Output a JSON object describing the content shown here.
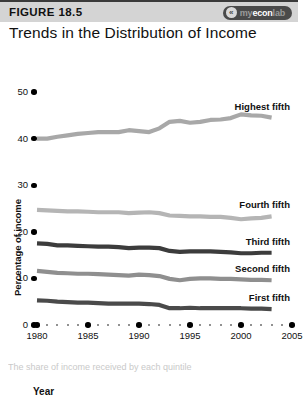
{
  "header": {
    "figure_number": "FIGURE 18.5",
    "brand_mark_glyph": "«",
    "brand_prefix": "my",
    "brand_main": "econ",
    "brand_suffix": "lab",
    "brand_full": "myeconlab"
  },
  "title": "Trends in the Distribution of Income",
  "bottom_caption": "The share of income received by each quintile",
  "chart_data": {
    "type": "line",
    "title": "Trends in the Distribution of Income",
    "xlabel": "Year",
    "ylabel": "Percentage of income",
    "xlim": [
      1980,
      2005
    ],
    "ylim": [
      0,
      50
    ],
    "y_ticks": [
      0,
      10,
      20,
      30,
      40,
      50
    ],
    "x_ticks": [
      1980,
      1985,
      1990,
      1995,
      2000,
      2005
    ],
    "x_minor_step": 1,
    "grid": false,
    "legend": "inline-end-labels",
    "x": [
      1980,
      1981,
      1982,
      1983,
      1984,
      1985,
      1986,
      1987,
      1988,
      1989,
      1990,
      1991,
      1992,
      1993,
      1994,
      1995,
      1996,
      1997,
      1998,
      1999,
      2000,
      2001,
      2002,
      2003
    ],
    "series": [
      {
        "name": "Highest fifth",
        "color": "#a8a8a8",
        "values": [
          40.0,
          40.0,
          40.4,
          40.7,
          41.0,
          41.2,
          41.4,
          41.4,
          41.4,
          41.8,
          41.6,
          41.4,
          42.2,
          43.6,
          43.8,
          43.4,
          43.6,
          44.0,
          44.1,
          44.4,
          45.2,
          45.0,
          44.9,
          44.5
        ]
      },
      {
        "name": "Fourth fifth",
        "color": "#b5b5b5",
        "values": [
          24.7,
          24.6,
          24.5,
          24.4,
          24.4,
          24.3,
          24.2,
          24.2,
          24.2,
          24.0,
          24.1,
          24.2,
          24.0,
          23.5,
          23.4,
          23.3,
          23.3,
          23.2,
          23.2,
          23.0,
          22.7,
          22.9,
          23.0,
          23.3
        ]
      },
      {
        "name": "Third fifth",
        "color": "#3c3c3c",
        "values": [
          17.5,
          17.4,
          17.1,
          17.1,
          17.0,
          16.9,
          16.8,
          16.8,
          16.7,
          16.5,
          16.6,
          16.6,
          16.5,
          15.9,
          15.7,
          15.8,
          15.8,
          15.8,
          15.7,
          15.6,
          15.4,
          15.4,
          15.5,
          15.5
        ]
      },
      {
        "name": "Second fifth",
        "color": "#8f8f8f",
        "values": [
          11.6,
          11.4,
          11.2,
          11.1,
          11.0,
          11.0,
          10.9,
          10.8,
          10.7,
          10.6,
          10.8,
          10.7,
          10.5,
          9.9,
          9.6,
          9.9,
          10.0,
          10.0,
          9.9,
          9.9,
          9.8,
          9.7,
          9.7,
          9.6
        ]
      },
      {
        "name": "First fifth",
        "color": "#4a4a4a",
        "values": [
          5.3,
          5.2,
          5.0,
          4.9,
          4.8,
          4.8,
          4.7,
          4.6,
          4.6,
          4.6,
          4.6,
          4.5,
          4.3,
          3.6,
          3.6,
          3.7,
          3.6,
          3.6,
          3.6,
          3.6,
          3.6,
          3.5,
          3.5,
          3.4
        ]
      }
    ]
  }
}
